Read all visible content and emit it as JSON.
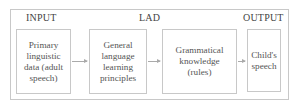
{
  "diagram": {
    "title_labels": {
      "input": "INPUT",
      "lad": "LAD",
      "output": "OUTPUT"
    },
    "nodes": [
      {
        "id": "primary-data",
        "text": "Primary\nlinguistic\ndata (adult\nspeech)"
      },
      {
        "id": "general-principles",
        "text": "General\nlanguage\nlearning\nprinciples"
      },
      {
        "id": "grammatical-knowledge",
        "text": "Grammatical\nknowledge\n(rules)"
      },
      {
        "id": "childs-speech",
        "text": "Child's\nspeech"
      }
    ],
    "edges": [
      {
        "from": "primary-data",
        "to": "general-principles"
      },
      {
        "from": "general-principles",
        "to": "grammatical-knowledge"
      },
      {
        "from": "grammatical-knowledge",
        "to": "childs-speech"
      }
    ]
  }
}
